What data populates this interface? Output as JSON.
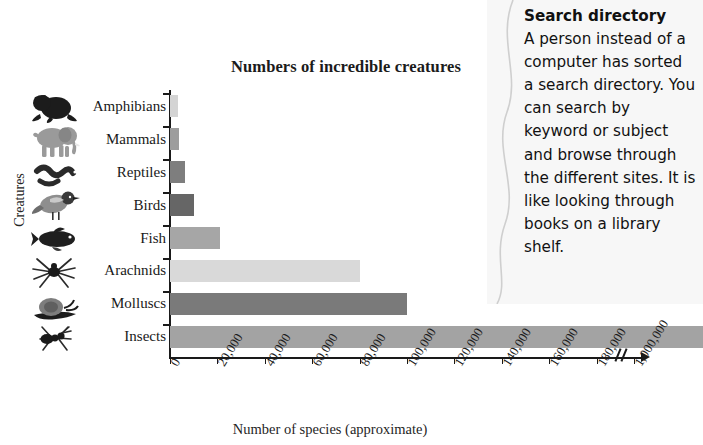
{
  "chart_data": {
    "type": "bar",
    "orientation": "horizontal",
    "title": "Numbers of incredible creatures",
    "xlabel": "Number of species (approximate)",
    "ylabel": "Creatures",
    "grid": false,
    "legend": null,
    "axis_break_after": 180000,
    "xlim": [
      0,
      200000
    ],
    "categories": [
      "Amphibians",
      "Mammals",
      "Reptiles",
      "Birds",
      "Fish",
      "Arachnids",
      "Molluscs",
      "Insects"
    ],
    "values": [
      3500,
      4000,
      6500,
      10000,
      21000,
      80000,
      100000,
      1000000
    ],
    "tick_labels": [
      "0",
      "20,000",
      "40,000",
      "60,000",
      "80,000",
      "100,000",
      "120,000",
      "140,000",
      "160,000",
      "180,000",
      "1,000,000"
    ],
    "tick_values": [
      0,
      20000,
      40000,
      60000,
      80000,
      100000,
      120000,
      140000,
      160000,
      180000,
      1000000
    ],
    "bar_colors": [
      "#d4d4d4",
      "#9d9d9d",
      "#7e7e7e",
      "#666666",
      "#a6a6a6",
      "#d9d9d9",
      "#7a7a7a",
      "#a3a3a3"
    ],
    "icons": [
      "frog-icon",
      "elephant-icon",
      "snake-icon",
      "bird-icon",
      "fish-icon",
      "spider-icon",
      "snail-icon",
      "ant-icon"
    ]
  },
  "side_panel": {
    "heading": "Search directory",
    "body": "A person instead of a computer has sorted a search directory. You can search by keyword or subject and browse through the different sites. It is like looking through books on a library shelf."
  }
}
